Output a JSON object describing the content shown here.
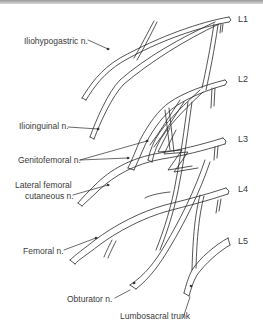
{
  "diagram": {
    "levels": [
      "L1",
      "L2",
      "L3",
      "L4",
      "L5"
    ],
    "labels": {
      "iliohypogastric": "Iliohypogastric n.",
      "ilioinguinal": "Ilioinguinal n.",
      "genitofemoral": "Genitofemoral n.",
      "lateral_femoral_line1": "Lateral femoral",
      "lateral_femoral_line2": "cutaneous n.",
      "femoral": "Femoral n.",
      "obturator": "Obturator n.",
      "lumbosacral": "Lumbosacral trunk"
    },
    "colors": {
      "line": "#2a2a2a",
      "text": "#3a3a3a",
      "background": "#ffffff"
    }
  }
}
